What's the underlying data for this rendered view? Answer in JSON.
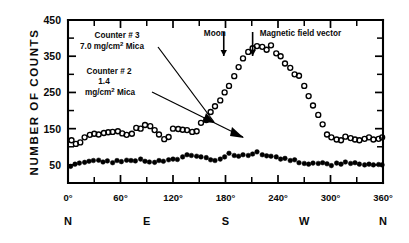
{
  "figure": {
    "ylabel": "NUMBER OF COUNTS",
    "y_ticks": [
      "450",
      "350",
      "250",
      "150",
      "50"
    ],
    "x_ticks": [
      "0°",
      "60°",
      "120°",
      "180°",
      "240°",
      "300°",
      "360°"
    ],
    "compass": [
      "N",
      "E",
      "S",
      "W",
      "N"
    ],
    "annotations": {
      "counter3_line1": "Counter # 3",
      "counter3_line2": "7.0 mg/cm",
      "counter3_line2_sup": "2",
      "counter3_line2_tail": " Mica",
      "counter2_line1": "Counter # 2",
      "counter2_line2": "1.4",
      "counter2_line3": "mg/cm",
      "counter2_line3_sup": "2",
      "counter2_line3_tail": " Mica",
      "moon": "Moon",
      "field": "Magnetic field vector"
    }
  },
  "chart_data": {
    "type": "scatter",
    "title": "",
    "xlabel": "",
    "ylabel": "NUMBER OF COUNTS",
    "xlim": [
      0,
      360
    ],
    "ylim": [
      0,
      450
    ],
    "grid": false,
    "legend_position": "in-plot-annotations",
    "x_tick_values": [
      0,
      60,
      120,
      180,
      240,
      300,
      360
    ],
    "x_tick_labels": [
      "0°",
      "60°",
      "120°",
      "180°",
      "240°",
      "300°",
      "360°"
    ],
    "x_compass_labels": [
      {
        "label": "N",
        "x": 0
      },
      {
        "label": "E",
        "x": 90
      },
      {
        "label": "S",
        "x": 180
      },
      {
        "label": "W",
        "x": 270
      },
      {
        "label": "N",
        "x": 360
      }
    ],
    "y_tick_values": [
      50,
      150,
      250,
      350,
      450
    ],
    "y_minor_tick_values": [
      100,
      200,
      300,
      400
    ],
    "annotations": [
      {
        "name": "moon-marker",
        "label": "Moon",
        "x": 178,
        "type": "vertical-arrow"
      },
      {
        "name": "magnetic-field-marker",
        "label": "Magnetic field vector",
        "x": 211,
        "type": "vertical-arrow"
      }
    ],
    "series": [
      {
        "name": "Counter # 3, 7.0 mg/cm2 Mica",
        "marker": "open-circle",
        "color": "#000000",
        "points": [
          [
            4,
            118
          ],
          [
            9,
            108
          ],
          [
            14,
            112
          ],
          [
            19,
            126
          ],
          [
            25,
            133
          ],
          [
            30,
            136
          ],
          [
            35,
            134
          ],
          [
            41,
            138
          ],
          [
            46,
            140
          ],
          [
            51,
            141
          ],
          [
            57,
            143
          ],
          [
            62,
            137
          ],
          [
            67,
            133
          ],
          [
            73,
            136
          ],
          [
            78,
            152
          ],
          [
            83,
            150
          ],
          [
            88,
            160
          ],
          [
            94,
            157
          ],
          [
            99,
            146
          ],
          [
            104,
            134
          ],
          [
            110,
            121
          ],
          [
            115,
            127
          ],
          [
            120,
            150
          ],
          [
            126,
            149
          ],
          [
            131,
            147
          ],
          [
            136,
            146
          ],
          [
            142,
            141
          ],
          [
            147,
            143
          ],
          [
            152,
            166
          ],
          [
            158,
            174
          ],
          [
            163,
            196
          ],
          [
            168,
            212
          ],
          [
            174,
            228
          ],
          [
            179,
            250
          ],
          [
            184,
            268
          ],
          [
            190,
            295
          ],
          [
            195,
            320
          ],
          [
            200,
            344
          ],
          [
            206,
            362
          ],
          [
            211,
            372
          ],
          [
            216,
            378
          ],
          [
            222,
            376
          ],
          [
            227,
            368
          ],
          [
            232,
            380
          ],
          [
            238,
            358
          ],
          [
            243,
            350
          ],
          [
            248,
            330
          ],
          [
            254,
            318
          ],
          [
            259,
            300
          ],
          [
            264,
            296
          ],
          [
            270,
            268
          ],
          [
            275,
            240
          ],
          [
            280,
            214
          ],
          [
            286,
            188
          ],
          [
            291,
            162
          ],
          [
            296,
            134
          ],
          [
            301,
            126
          ],
          [
            307,
            120
          ],
          [
            312,
            118
          ],
          [
            317,
            128
          ],
          [
            323,
            124
          ],
          [
            328,
            120
          ],
          [
            333,
            118
          ],
          [
            339,
            122
          ],
          [
            344,
            126
          ],
          [
            349,
            120
          ],
          [
            355,
            122
          ],
          [
            359,
            126
          ]
        ]
      },
      {
        "name": "Counter # 2, 1.4 mg/cm2 Mica",
        "marker": "filled-circle",
        "color": "#000000",
        "points": [
          [
            3,
            46
          ],
          [
            8,
            52
          ],
          [
            13,
            55
          ],
          [
            19,
            57
          ],
          [
            24,
            60
          ],
          [
            29,
            62
          ],
          [
            35,
            63
          ],
          [
            40,
            58
          ],
          [
            45,
            61
          ],
          [
            51,
            56
          ],
          [
            56,
            62
          ],
          [
            61,
            59
          ],
          [
            67,
            63
          ],
          [
            72,
            62
          ],
          [
            77,
            61
          ],
          [
            83,
            66
          ],
          [
            88,
            60
          ],
          [
            93,
            58
          ],
          [
            99,
            57
          ],
          [
            104,
            62
          ],
          [
            109,
            60
          ],
          [
            115,
            64
          ],
          [
            120,
            66
          ],
          [
            125,
            65
          ],
          [
            131,
            72
          ],
          [
            136,
            78
          ],
          [
            141,
            76
          ],
          [
            147,
            74
          ],
          [
            152,
            72
          ],
          [
            158,
            70
          ],
          [
            163,
            64
          ],
          [
            168,
            62
          ],
          [
            174,
            66
          ],
          [
            179,
            72
          ],
          [
            184,
            82
          ],
          [
            190,
            76
          ],
          [
            195,
            74
          ],
          [
            200,
            78
          ],
          [
            206,
            76
          ],
          [
            211,
            80
          ],
          [
            216,
            86
          ],
          [
            222,
            78
          ],
          [
            227,
            75
          ],
          [
            232,
            74
          ],
          [
            238,
            72
          ],
          [
            243,
            66
          ],
          [
            248,
            68
          ],
          [
            254,
            62
          ],
          [
            259,
            64
          ],
          [
            264,
            56
          ],
          [
            270,
            54
          ],
          [
            275,
            52
          ],
          [
            280,
            55
          ],
          [
            286,
            54
          ],
          [
            291,
            56
          ],
          [
            296,
            53
          ],
          [
            301,
            48
          ],
          [
            307,
            55
          ],
          [
            312,
            52
          ],
          [
            317,
            58
          ],
          [
            323,
            54
          ],
          [
            328,
            56
          ],
          [
            333,
            52
          ],
          [
            339,
            50
          ],
          [
            344,
            52
          ],
          [
            349,
            50
          ],
          [
            355,
            51
          ],
          [
            359,
            50
          ]
        ]
      }
    ]
  }
}
